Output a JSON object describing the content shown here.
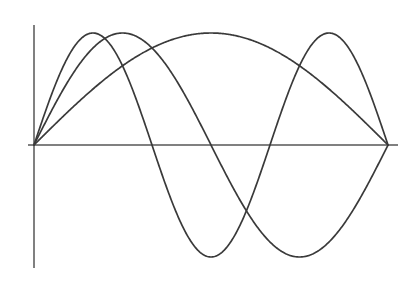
{
  "figure": {
    "background_color": "#ffffff",
    "width": 419,
    "height": 282
  },
  "axes": {
    "axis_color": "#808080",
    "x_axis": {
      "name": "horizontal-axis",
      "y_pixel": 145,
      "x_start_pixel": 28,
      "x_end_pixel": 398
    },
    "y_axis": {
      "name": "vertical-axis",
      "x_pixel": 34,
      "y_start_pixel": 25,
      "y_end_pixel": 268
    }
  },
  "chart_data": {
    "type": "line",
    "title": "",
    "subtitle": "",
    "xlabel": "",
    "ylabel": "",
    "grid": false,
    "legend": false,
    "legend_position": "none",
    "xlim": [
      0,
      6.2832
    ],
    "ylim": [
      -1.15,
      1.15
    ],
    "x_tick_labels": [],
    "y_tick_labels": [],
    "curve_color": "#3a3a3a",
    "curve_width": 1.7,
    "x_sample_count": 400,
    "series": [
      {
        "name": "fundamental",
        "label": "sin(x)",
        "harmonic": 1,
        "amplitude": 1.0,
        "period_fraction": 1,
        "color": "#3a3a3a",
        "peak_x_pixels": [
          211
        ],
        "peak_y_pixel": 33,
        "trough_x_pixels": [],
        "zero_x_pixels": [
          34,
          388
        ]
      },
      {
        "name": "second-harmonic",
        "label": "sin(2x)",
        "harmonic": 2,
        "amplitude": 1.0,
        "period_fraction": 2,
        "color": "#3a3a3a",
        "peak_x_pixels": [
          123
        ],
        "peak_y_pixel": 33,
        "trough_x_pixels": [
          300
        ],
        "trough_y_pixel": 257,
        "zero_x_pixels": [
          34,
          211,
          388
        ]
      },
      {
        "name": "third-harmonic",
        "label": "sin(3x)",
        "harmonic": 3,
        "amplitude": 1.0,
        "period_fraction": 3,
        "color": "#3a3a3a",
        "peak_x_pixels": [
          94,
          329
        ],
        "peak_y_pixel": 33,
        "trough_x_pixels": [
          211
        ],
        "trough_y_pixel": 257,
        "zero_x_pixels": [
          34,
          152,
          270,
          388
        ]
      }
    ],
    "origin_pixel": [
      34,
      145
    ],
    "right_node_pixel": [
      388,
      145
    ],
    "center_node_pixel": [
      211,
      145
    ],
    "amplitude_pixels": 112
  }
}
